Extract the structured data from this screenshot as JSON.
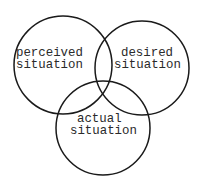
{
  "diagram": {
    "type": "venn",
    "circles": [
      {
        "id": "perceived",
        "label_lines": [
          "perceived",
          "situation"
        ],
        "cx": 63,
        "cy": 65,
        "r": 49
      },
      {
        "id": "desired",
        "label_lines": [
          "desired",
          "situation"
        ],
        "cx": 142,
        "cy": 68,
        "r": 47
      },
      {
        "id": "actual",
        "label_lines": [
          "actual",
          "situation"
        ],
        "cx": 103,
        "cy": 128,
        "r": 47
      }
    ],
    "stroke_color": "#1a1a1a",
    "background": "#ffffff"
  }
}
